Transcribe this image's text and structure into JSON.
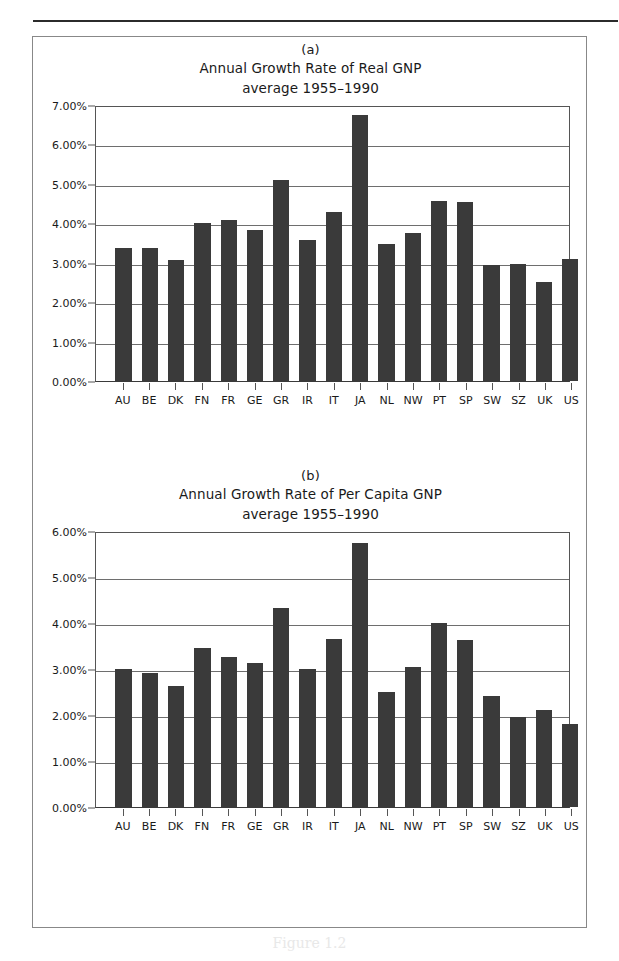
{
  "figure": {
    "caption": "Figure 1.2"
  },
  "panels": [
    {
      "letter": "(a)",
      "title": "Annual Growth Rate of Real GNP",
      "subtitle": "average 1955–1990"
    },
    {
      "letter": "(b)",
      "title": "Annual Growth Rate of Per Capita GNP",
      "subtitle": "average 1955–1990"
    }
  ],
  "chart_data": [
    {
      "type": "bar",
      "panel": "(a)",
      "title": "Annual Growth Rate of Real GNP",
      "subtitle": "average 1955-1990",
      "xlabel": "",
      "ylabel": "",
      "ylim": [
        0,
        7
      ],
      "yticks": [
        0,
        1,
        2,
        3,
        4,
        5,
        6,
        7
      ],
      "ytick_labels": [
        "0.00%",
        "1.00%",
        "2.00%",
        "3.00%",
        "4.00%",
        "5.00%",
        "6.00%",
        "7.00%"
      ],
      "grid": true,
      "legend": "none",
      "bar_color": "#3a3a3a",
      "units": "percent",
      "categories": [
        "AU",
        "BE",
        "DK",
        "FN",
        "FR",
        "GE",
        "GR",
        "IR",
        "IT",
        "JA",
        "NL",
        "NW",
        "PT",
        "SP",
        "SW",
        "SZ",
        "UK",
        "US"
      ],
      "values": [
        3.37,
        3.37,
        3.07,
        4.0,
        4.08,
        3.83,
        5.1,
        3.57,
        4.28,
        6.75,
        3.48,
        3.76,
        4.56,
        4.53,
        2.95,
        2.98,
        2.52,
        3.1
      ]
    },
    {
      "type": "bar",
      "panel": "(b)",
      "title": "Annual Growth Rate of Per Capita GNP",
      "subtitle": "average 1955-1990",
      "xlabel": "",
      "ylabel": "",
      "ylim": [
        0,
        6
      ],
      "yticks": [
        0,
        1,
        2,
        3,
        4,
        5,
        6
      ],
      "ytick_labels": [
        "0.00%",
        "1.00%",
        "2.00%",
        "3.00%",
        "4.00%",
        "5.00%",
        "6.00%"
      ],
      "grid": true,
      "legend": "none",
      "bar_color": "#3a3a3a",
      "units": "percent",
      "categories": [
        "AU",
        "BE",
        "DK",
        "FN",
        "FR",
        "GE",
        "GR",
        "IR",
        "IT",
        "JA",
        "NL",
        "NW",
        "PT",
        "SP",
        "SW",
        "SZ",
        "UK",
        "US"
      ],
      "values": [
        3.01,
        2.91,
        2.63,
        3.46,
        3.27,
        3.14,
        4.33,
        3.01,
        3.66,
        5.74,
        2.51,
        3.05,
        4.0,
        3.62,
        2.42,
        1.95,
        2.1,
        1.81
      ]
    }
  ]
}
